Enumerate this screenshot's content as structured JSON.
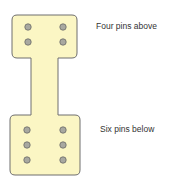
{
  "labels": {
    "top": "Four pins above",
    "bottom": "Six pins below"
  },
  "colors": {
    "board_fill": "#fbf6c4",
    "board_stroke": "#6e6e6e",
    "pin_fill": "#a8a8a0",
    "pin_stroke": "#6a6a66"
  },
  "pins": {
    "top_count": 4,
    "bottom_count": 6
  }
}
